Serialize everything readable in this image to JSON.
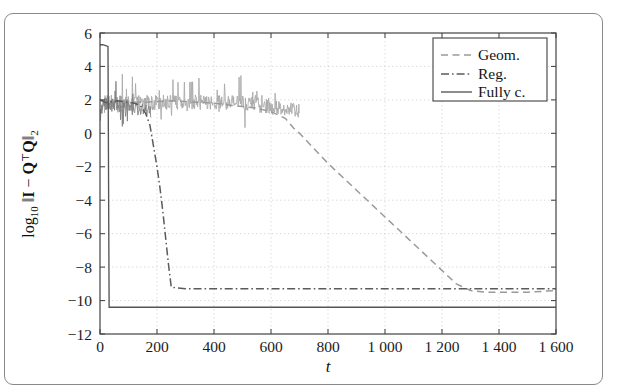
{
  "figure": {
    "has_border": true,
    "border_color": "#8a8a8a"
  },
  "chart_data": {
    "type": "line",
    "title": "",
    "xlabel": "t",
    "ylabel": "log_10 ||I - Q^T Q||_2",
    "ylabel_parts": {
      "log": "log",
      "log_sub": "10",
      "norm_open": "‖",
      "identity": "I",
      "minus": "−",
      "q_transpose": "Q",
      "transpose_sup": "⊤",
      "q": "Q",
      "norm_close": "‖",
      "norm_sub": "2"
    },
    "xlim": [
      0,
      1600
    ],
    "ylim": [
      -12,
      6
    ],
    "xticks": [
      0,
      200,
      400,
      600,
      800,
      1000,
      1200,
      1400,
      1600
    ],
    "xticklabels": [
      "0",
      "200",
      "400",
      "600",
      "800",
      "1 000",
      "1 200",
      "1 400",
      "1 600"
    ],
    "yticks": [
      6,
      4,
      2,
      0,
      -2,
      -4,
      -6,
      -8,
      -10,
      -12
    ],
    "yticklabels": [
      "6",
      "4",
      "2",
      "0",
      "−2",
      "−4",
      "−6",
      "−8",
      "−10",
      "−12"
    ],
    "grid": true,
    "grid_style": "dotted",
    "legend_position": "upper right",
    "series": [
      {
        "name": "Geom.",
        "style": "dashed",
        "color": "#9a9a9a",
        "x": [
          0,
          20,
          40,
          60,
          80,
          100,
          150,
          200,
          250,
          300,
          350,
          400,
          450,
          500,
          550,
          600,
          650,
          680,
          700,
          750,
          800,
          850,
          900,
          950,
          1000,
          1050,
          1100,
          1150,
          1200,
          1250,
          1300,
          1350,
          1400,
          1450,
          1500,
          1550,
          1600
        ],
        "values": [
          2.0,
          1.9,
          1.95,
          2.0,
          1.95,
          1.9,
          1.85,
          1.9,
          1.95,
          1.9,
          1.85,
          1.8,
          1.7,
          1.6,
          1.5,
          1.3,
          0.9,
          0.3,
          0.0,
          -0.9,
          -1.8,
          -2.6,
          -3.4,
          -4.2,
          -5.0,
          -5.8,
          -6.6,
          -7.4,
          -8.2,
          -9.0,
          -9.4,
          -9.5,
          -9.5,
          -9.5,
          -9.5,
          -9.45,
          -9.4
        ]
      },
      {
        "name": "Reg.",
        "style": "dash-dot",
        "color": "#5b5b5b",
        "x": [
          0,
          20,
          40,
          60,
          80,
          100,
          120,
          140,
          160,
          175,
          190,
          200,
          210,
          220,
          230,
          240,
          250,
          300,
          400,
          500,
          600,
          700,
          800,
          900,
          1000,
          1100,
          1200,
          1300,
          1400,
          1500,
          1600
        ],
        "values": [
          2.0,
          1.85,
          1.9,
          1.95,
          1.9,
          1.85,
          1.8,
          1.7,
          1.2,
          0.5,
          -1.0,
          -2.0,
          -3.2,
          -4.6,
          -6.2,
          -7.8,
          -9.2,
          -9.3,
          -9.3,
          -9.3,
          -9.3,
          -9.3,
          -9.3,
          -9.3,
          -9.3,
          -9.3,
          -9.3,
          -9.3,
          -9.3,
          -9.3,
          -9.3
        ]
      },
      {
        "name": "Fully c.",
        "style": "solid",
        "color": "#555555",
        "x": [
          0,
          10,
          20,
          28,
          32,
          40,
          60,
          100,
          200,
          400,
          600,
          800,
          1000,
          1200,
          1400,
          1600
        ],
        "values": [
          5.3,
          5.3,
          5.25,
          5.2,
          -10.4,
          -10.4,
          -10.4,
          -10.4,
          -10.4,
          -10.4,
          -10.4,
          -10.4,
          -10.4,
          -10.4,
          -10.4,
          -10.4
        ]
      }
    ],
    "noise": {
      "description": "Geom. and Reg. traces are noisy oscillating bands before convergence",
      "band_center": 1.85,
      "band_amplitude": 0.45,
      "spike_max": 3.6,
      "noise_end_geom": 700,
      "noise_end_reg": 180
    }
  },
  "legend": {
    "entries": [
      {
        "label": "Geom.",
        "style": "dashed"
      },
      {
        "label": "Reg.",
        "style": "dash-dot"
      },
      {
        "label": "Fully c.",
        "style": "solid"
      }
    ]
  }
}
